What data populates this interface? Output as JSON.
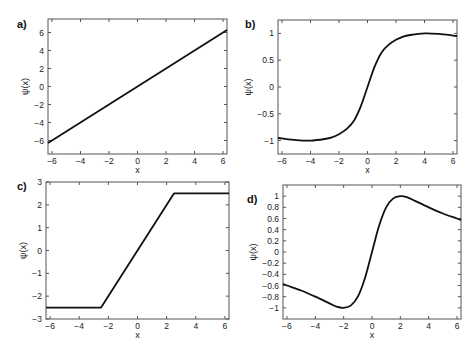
{
  "chart_data": [
    {
      "panel": "a)",
      "type": "line",
      "xlabel": "x",
      "ylabel": "ψ(x)",
      "xlim": [
        -6.28,
        6.28
      ],
      "ylim": [
        -7.5,
        7.5
      ],
      "xticks": [
        -6,
        -4,
        -2,
        0,
        2,
        4,
        6
      ],
      "yticks": [
        -6,
        -4,
        -2,
        0,
        2,
        4,
        6
      ],
      "ytick_labels": [
        "−6",
        "−4",
        "−2",
        "0",
        "2",
        "4",
        "6"
      ],
      "xtick_labels": [
        "−6",
        "−4",
        "−2",
        "0",
        "2",
        "4",
        "6"
      ],
      "grid": false,
      "series": [
        {
          "name": "psi",
          "x": [
            -6.28,
            6.28
          ],
          "y": [
            -6.28,
            6.28
          ]
        }
      ],
      "frame": {
        "left": 48,
        "top": 19,
        "right": 227,
        "bottom": 154
      }
    },
    {
      "panel": "b)",
      "type": "line",
      "xlabel": "x",
      "ylabel": "ψ(x)",
      "xlim": [
        -6.28,
        6.28
      ],
      "ylim": [
        -1.25,
        1.25
      ],
      "xticks": [
        -6,
        -4,
        -2,
        0,
        2,
        4,
        6
      ],
      "yticks": [
        -1,
        -0.5,
        0,
        0.5,
        1
      ],
      "ytick_labels": [
        "−1",
        "−0.5",
        "0",
        "0.5",
        "1"
      ],
      "xtick_labels": [
        "−6",
        "−4",
        "−2",
        "0",
        "2",
        "4",
        "6"
      ],
      "grid": false,
      "series": [
        {
          "name": "psi",
          "x": [
            -6.28,
            -6,
            -5,
            -4,
            -3,
            -2.5,
            -2,
            -1.5,
            -1,
            -0.5,
            0,
            0.5,
            1,
            1.5,
            2,
            2.5,
            3,
            4,
            5,
            6,
            6.28
          ],
          "y": [
            -0.95,
            -0.96,
            -0.99,
            -1.0,
            -0.97,
            -0.94,
            -0.88,
            -0.79,
            -0.65,
            -0.38,
            0,
            0.38,
            0.65,
            0.79,
            0.88,
            0.94,
            0.97,
            1.0,
            0.99,
            0.96,
            0.95
          ]
        }
      ],
      "frame": {
        "left": 278,
        "top": 20,
        "right": 457,
        "bottom": 154
      }
    },
    {
      "panel": "c)",
      "type": "line",
      "xlabel": "x",
      "ylabel": "ψ(x)",
      "xlim": [
        -6.28,
        6.28
      ],
      "ylim": [
        -3,
        3
      ],
      "xticks": [
        -6,
        -4,
        -2,
        0,
        2,
        4,
        6
      ],
      "yticks": [
        -3,
        -2,
        -1,
        0,
        1,
        2,
        3
      ],
      "ytick_labels": [
        "−3",
        "−2",
        "−1",
        "0",
        "1",
        "2",
        "3"
      ],
      "xtick_labels": [
        "−6",
        "−4",
        "−2",
        "0",
        "2",
        "4",
        "6"
      ],
      "grid": false,
      "series": [
        {
          "name": "psi",
          "x": [
            -6.28,
            -2.5,
            2.5,
            6.28
          ],
          "y": [
            -2.5,
            -2.5,
            2.5,
            2.5
          ]
        }
      ],
      "frame": {
        "left": 46,
        "top": 182,
        "right": 229,
        "bottom": 319
      }
    },
    {
      "panel": "d)",
      "type": "line",
      "xlabel": "x",
      "ylabel": "ψ(x)",
      "xlim": [
        -6.28,
        6.28
      ],
      "ylim": [
        -1.2,
        1.2
      ],
      "xticks": [
        -6,
        -4,
        -2,
        0,
        2,
        4,
        6
      ],
      "yticks": [
        -1,
        -0.8,
        -0.6,
        -0.4,
        -0.2,
        0,
        0.2,
        0.4,
        0.6,
        0.8,
        1
      ],
      "ytick_labels": [
        "−1",
        "−0.8",
        "−0.6",
        "−0.4",
        "−0.2",
        "0",
        "0.2",
        "0.4",
        "0.6",
        "0.8",
        "1"
      ],
      "xtick_labels": [
        "−6",
        "−4",
        "−2",
        "0",
        "2",
        "4",
        "6"
      ],
      "grid": false,
      "series": [
        {
          "name": "psi",
          "x": [
            -6.28,
            -6,
            -5,
            -4,
            -3,
            -2.5,
            -2,
            -1.5,
            -1,
            -0.5,
            0,
            0.5,
            1,
            1.5,
            2,
            2.5,
            3,
            4,
            5,
            6,
            6.28
          ],
          "y": [
            -0.57,
            -0.6,
            -0.69,
            -0.8,
            -0.92,
            -0.98,
            -1.0,
            -0.96,
            -0.8,
            -0.47,
            0,
            0.47,
            0.8,
            0.96,
            1.0,
            0.98,
            0.92,
            0.8,
            0.69,
            0.6,
            0.57
          ]
        }
      ],
      "frame": {
        "left": 283,
        "top": 185,
        "right": 461,
        "bottom": 319
      }
    }
  ]
}
